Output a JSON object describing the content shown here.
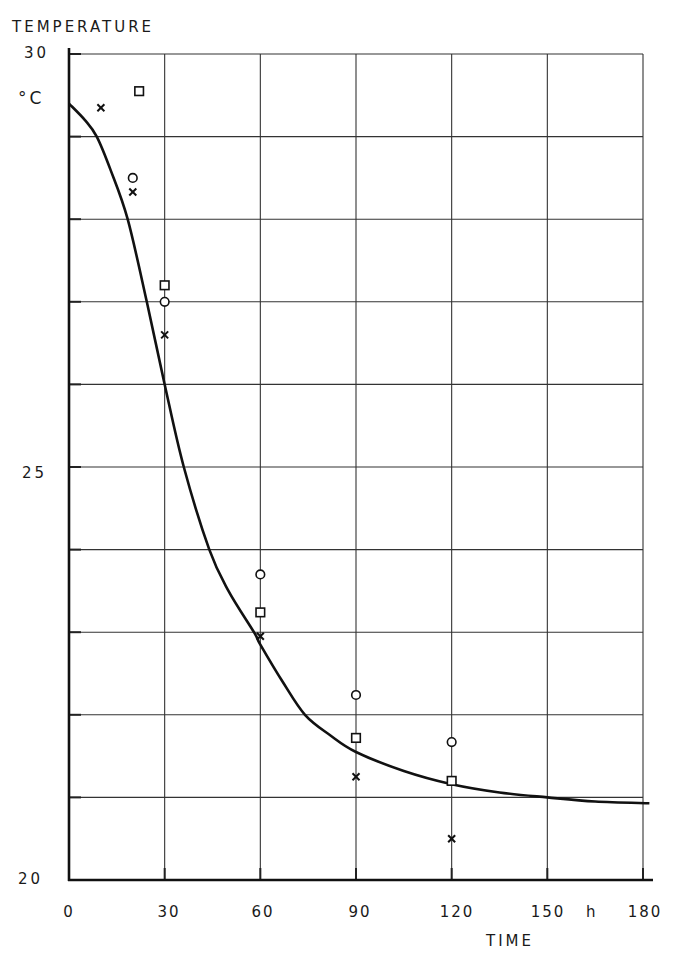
{
  "chart_data": {
    "type": "scatter",
    "title": "",
    "xlabel": "TIME",
    "x_unit": "h",
    "ylabel": "TEMPERATURE",
    "y_unit": "°C",
    "xlim": [
      0,
      180
    ],
    "ylim": [
      20,
      30
    ],
    "x_ticks": [
      "0",
      "30",
      "60",
      "90",
      "120",
      "150",
      "180"
    ],
    "y_ticks": [
      "20",
      "25",
      "30"
    ],
    "grid": true,
    "grid_x_step": 30,
    "grid_y_step": 1,
    "legend": null,
    "series": [
      {
        "name": "fitted curve",
        "kind": "line",
        "x": [
          0,
          5,
          8.7,
          13,
          18.4,
          24.4,
          30,
          36,
          44,
          50,
          58,
          60,
          67,
          74,
          82,
          90,
          105,
          120,
          135,
          150,
          165,
          182
        ],
        "y": [
          29.4,
          29.2,
          29.0,
          28.6,
          28.0,
          27.0,
          26.0,
          25.0,
          24.0,
          23.5,
          23.0,
          22.85,
          22.4,
          22.0,
          21.75,
          21.55,
          21.32,
          21.16,
          21.06,
          21.0,
          20.95,
          20.93
        ]
      },
      {
        "name": "x markers",
        "kind": "scatter",
        "marker": "x",
        "x": [
          10,
          20,
          30,
          60,
          90,
          120
        ],
        "y": [
          29.35,
          28.33,
          26.6,
          22.95,
          21.25,
          20.5
        ]
      },
      {
        "name": "circle markers",
        "kind": "scatter",
        "marker": "circle",
        "x": [
          20,
          30,
          60,
          90,
          120
        ],
        "y": [
          28.5,
          27.0,
          23.7,
          22.24,
          21.67
        ]
      },
      {
        "name": "square markers",
        "kind": "scatter",
        "marker": "square",
        "x": [
          22,
          30,
          60,
          90,
          120
        ],
        "y": [
          29.55,
          27.2,
          23.24,
          21.72,
          21.2
        ]
      }
    ]
  },
  "labels": {
    "y_title": "TEMPERATURE",
    "y_unit": "°C",
    "x_title": "TIME",
    "x_unit": "h"
  }
}
